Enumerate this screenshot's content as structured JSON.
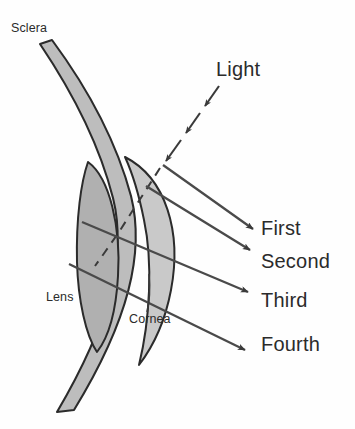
{
  "figure": {
    "background_color": "#fefefe",
    "ink_color": "#2b2b2b",
    "sclera_fill": "#bdbdbd",
    "cornea_fill": "#c9c9c9",
    "lens_fill": "#b0b0b0"
  },
  "labels": {
    "sclera": "Sclera",
    "lens": "Lens",
    "cornea": "Cornea",
    "light": "Light",
    "first": "First",
    "second": "Second",
    "third": "Third",
    "fourth": "Fourth"
  },
  "rays": {
    "incoming": {
      "name": "Light",
      "style": "dashed",
      "direction": "down-left",
      "arrowheads": 3
    },
    "reflections": [
      {
        "label": "First",
        "surface": "anterior cornea",
        "style": "solid"
      },
      {
        "label": "Second",
        "surface": "posterior cornea",
        "style": "solid"
      },
      {
        "label": "Third",
        "surface": "anterior lens",
        "style": "solid"
      },
      {
        "label": "Fourth",
        "surface": "posterior lens",
        "style": "solid"
      }
    ]
  }
}
